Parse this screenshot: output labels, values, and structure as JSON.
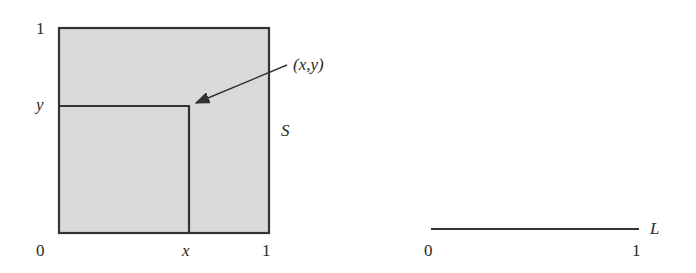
{
  "figure": {
    "square": {
      "label": "S",
      "fill": "#d9d9d9",
      "stroke": "#333333",
      "corner_labels": {
        "origin": "0",
        "x_max": "1",
        "y_max": "1"
      },
      "point": {
        "x_label": "x",
        "y_label": "y",
        "annotation": "(x,y)"
      }
    },
    "segment": {
      "label": "L",
      "start_label": "0",
      "end_label": "1"
    }
  }
}
